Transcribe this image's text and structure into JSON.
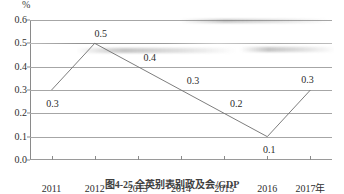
{
  "chart_data": {
    "type": "line",
    "title": "",
    "caption": "图4-25  全英别表别政及会/GDP",
    "xlabel": "",
    "ylabel": "",
    "unit_label": "%",
    "x_axis_suffix": "年",
    "categories": [
      "2011",
      "2012",
      "2013",
      "2014",
      "2015",
      "2016",
      "2017"
    ],
    "x_tick_labels": [
      "2011",
      "2012",
      "2013",
      "2014",
      "2015",
      "2016",
      "2017年"
    ],
    "values": [
      0.3,
      0.5,
      0.4,
      0.3,
      0.2,
      0.1,
      0.3
    ],
    "point_labels": [
      "0.3",
      "0.5",
      "0.4",
      "0.3",
      "0.2",
      "0.1",
      "0.3"
    ],
    "ylim": [
      0.0,
      0.6
    ],
    "ytick_values": [
      0.6,
      0.5,
      0.4,
      0.3,
      0.2,
      0.1,
      0.0
    ],
    "ytick_labels": [
      "0.6",
      "0.5",
      "0.4",
      "0.3",
      "0.2",
      "0.1",
      "0.0"
    ],
    "grid": true,
    "grid_orientation": "horizontal",
    "legend": false,
    "legend_position": "none",
    "series": [
      {
        "name": "",
        "values": [
          0.3,
          0.5,
          0.4,
          0.3,
          0.2,
          0.1,
          0.3
        ],
        "color": "#6e6e6e"
      }
    ],
    "colors": {
      "line": "#6e6e6e",
      "grid": "#a6a6a6",
      "axis": "#8a8a8a",
      "text": "#2b2b2b",
      "background": "#ffffff"
    }
  }
}
